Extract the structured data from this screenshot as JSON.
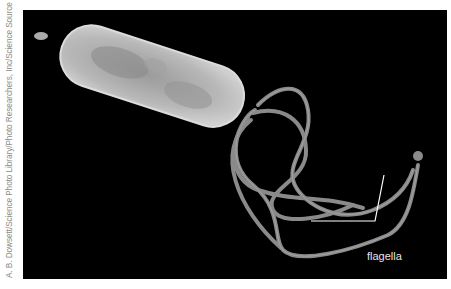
{
  "credit": "A. B. Dowsett/Science Photo Library/Photo Researchers, Inc/Science Source",
  "figure": {
    "label": "flagella",
    "colors": {
      "background": "#000000",
      "cell": "#b0b0b0",
      "flagella": "#8a8a8a",
      "leader_line": "#ffffff"
    }
  }
}
